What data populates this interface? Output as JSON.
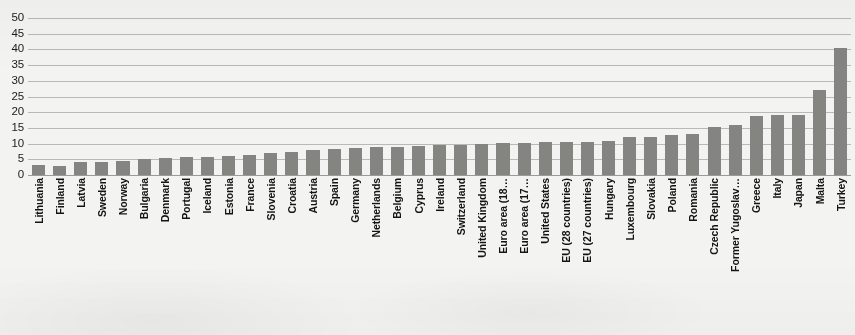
{
  "chart_data": {
    "type": "bar",
    "title": "",
    "xlabel": "",
    "ylabel": "",
    "ylim": [
      0,
      50
    ],
    "yticks": [
      50,
      45,
      40,
      35,
      30,
      25,
      20,
      15,
      10,
      5,
      0
    ],
    "grid": true,
    "legend": "none",
    "bar_color": "#848481",
    "background_color": "#f3f3f1",
    "categories": [
      "Lithuania",
      "Finland",
      "Latvia",
      "Sweden",
      "Norway",
      "Bulgaria",
      "Denmark",
      "Portugal",
      "Iceland",
      "Estonia",
      "France",
      "Slovenia",
      "Croatia",
      "Austria",
      "Spain",
      "Germany",
      "Netherlands",
      "Belgium",
      "Cyprus",
      "Ireland",
      "Switzerland",
      "United Kingdom",
      "Euro area (18…",
      "Euro area (17…",
      "United States",
      "EU (28 countries)",
      "EU (27 countries)",
      "Hungary",
      "Luxembourg",
      "Slovakia",
      "Poland",
      "Romania",
      "Czech Republic",
      "Former Yugoslav…",
      "Greece",
      "Italy",
      "Japan",
      "Malta",
      "Turkey"
    ],
    "values": [
      3.2,
      3.0,
      4.0,
      4.3,
      4.5,
      5.0,
      5.5,
      5.6,
      5.7,
      6.0,
      6.3,
      7.0,
      7.4,
      8.0,
      8.3,
      8.6,
      8.8,
      9.0,
      9.2,
      9.4,
      9.6,
      10.0,
      10.2,
      10.3,
      10.4,
      10.5,
      10.6,
      10.8,
      12.0,
      12.2,
      12.6,
      13.0,
      15.2,
      16.0,
      18.8,
      19.0,
      19.2,
      27.0,
      40.3
    ]
  },
  "figure": {
    "name": "bar-chart"
  }
}
